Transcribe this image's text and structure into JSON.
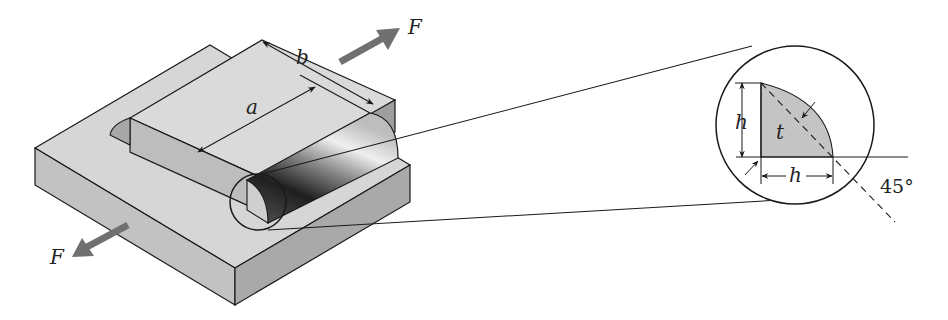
{
  "figure": {
    "labels": {
      "force_top": "F",
      "force_bottom": "F",
      "weld_length": "a",
      "plate_width": "b",
      "leg_vertical": "h",
      "leg_horizontal": "h",
      "throat": "t",
      "angle": "45°"
    },
    "colors": {
      "plate_top": "#d9d9d9",
      "plate_front": "#c4c4c4",
      "plate_side": "#b5b5b5",
      "weld_fill": "#b0b0b0",
      "arrow": "#707070",
      "stroke": "#1a1a1a"
    }
  }
}
